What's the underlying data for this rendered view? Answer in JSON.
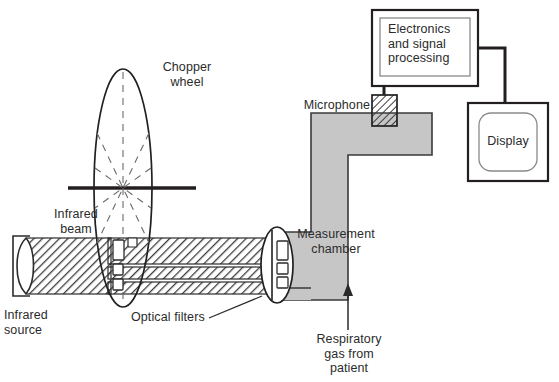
{
  "diagram": {
    "colors": {
      "ink": "#231f20",
      "chamber_fill": "#c6c6c6",
      "chamber_stroke": "#3a3a3a",
      "inner_box_stroke": "#8a8a8a",
      "hatch": "#3d3d3d",
      "background": "#ffffff"
    },
    "labels": {
      "chopper_wheel": "Chopper\nwheel",
      "infrared_beam": "Infrared\nbeam",
      "infrared_source": "Infrared\nsource",
      "optical_filters": "Optical filters",
      "measurement_chamber": "Measurement\nchamber",
      "microphone": "Microphone",
      "electronics": "Electronics\nand signal\nprocessing",
      "display": "Display",
      "respiratory_gas": "Respiratory\ngas from\npatient"
    },
    "components": [
      {
        "name": "infrared-source",
        "label": "Infrared source"
      },
      {
        "name": "infrared-beam",
        "label": "Infrared beam"
      },
      {
        "name": "chopper-wheel",
        "label": "Chopper wheel"
      },
      {
        "name": "optical-filters",
        "label": "Optical filters"
      },
      {
        "name": "measurement-chamber",
        "label": "Measurement chamber"
      },
      {
        "name": "microphone",
        "label": "Microphone"
      },
      {
        "name": "electronics-box",
        "label": "Electronics and signal processing"
      },
      {
        "name": "display-box",
        "label": "Display"
      },
      {
        "name": "gas-inlet-arrow",
        "label": "Respiratory gas from patient"
      }
    ]
  }
}
